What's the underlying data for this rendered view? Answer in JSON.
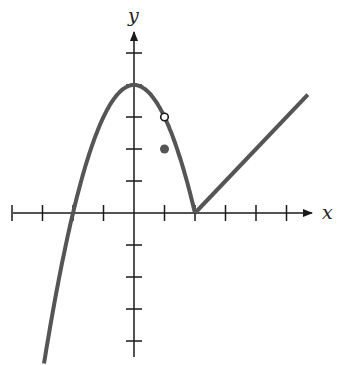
{
  "chart_data": {
    "type": "line",
    "title": "",
    "xlabel": "x",
    "ylabel": "y",
    "xlim": [
      -4.2,
      6.2
    ],
    "ylim": [
      -4.6,
      5.7
    ],
    "grid": false,
    "x_ticks": [
      -4,
      -3,
      -2,
      -1,
      1,
      2,
      3,
      4,
      5
    ],
    "y_ticks": [
      -4,
      -3,
      -2,
      -1,
      1,
      2,
      3,
      4,
      5
    ],
    "tick_labels_shown": false,
    "series": [
      {
        "name": "parabola piece",
        "description": "y = 4 - x^2 for x <= 2",
        "points": [
          [
            -2.9,
            -4.4
          ],
          [
            -2,
            0
          ],
          [
            -1,
            3
          ],
          [
            0,
            4
          ],
          [
            1,
            3
          ],
          [
            2,
            0
          ]
        ]
      },
      {
        "name": "linear piece",
        "description": "y = x - 2 for x >= 2",
        "points": [
          [
            2,
            0
          ],
          [
            5.7,
            3.7
          ]
        ]
      }
    ],
    "annotations": [
      {
        "type": "open_circle",
        "x": 1,
        "y": 3
      },
      {
        "type": "filled_circle",
        "x": 1,
        "y": 2
      }
    ],
    "colors": {
      "curve": "#555555",
      "axes": "#1a1a1a"
    }
  },
  "labels": {
    "x_axis": "x",
    "y_axis": "y"
  }
}
